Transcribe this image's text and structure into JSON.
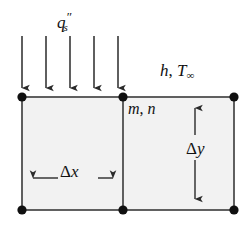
{
  "figure": {
    "name": "finite-difference-surface-node-control-volume",
    "width": 247,
    "height": 228,
    "background_color": "#ffffff",
    "line_color": "#3a3a3a",
    "node_color": "#101010",
    "cell_fill_color": "#f2f2f2"
  },
  "labels": {
    "heat_flux": {
      "base": "q",
      "subscript": "s",
      "superscript": "″",
      "full": "q″s"
    },
    "convection": {
      "h": "h",
      "comma": ",",
      "t": "T",
      "subscript": "∞",
      "full": "h, T∞"
    },
    "node_index": {
      "m": "m",
      "comma": ",",
      "n": "n",
      "full": "m, n"
    },
    "delta_x": {
      "delta": "Δ",
      "variable": "x",
      "full": "Δx"
    },
    "delta_y": {
      "delta": "Δ",
      "variable": "y",
      "full": "Δy"
    }
  },
  "geometry": {
    "grid": {
      "left_x": 22,
      "mid_x": 123,
      "right_x": 234,
      "top_y": 97,
      "bottom_y": 210
    },
    "nodes": [
      {
        "name": "node-top-left",
        "x": 22,
        "y": 97
      },
      {
        "name": "node-top-middle",
        "x": 123,
        "y": 97
      },
      {
        "name": "node-top-right",
        "x": 234,
        "y": 97
      },
      {
        "name": "node-bottom-left",
        "x": 22,
        "y": 210
      },
      {
        "name": "node-bottom-middle",
        "x": 123,
        "y": 210
      },
      {
        "name": "node-bottom-right",
        "x": 234,
        "y": 210
      }
    ],
    "flux_arrows": [
      {
        "x": 22,
        "y_start": 36,
        "y_end": 95
      },
      {
        "x": 46,
        "y_start": 36,
        "y_end": 95
      },
      {
        "x": 70,
        "y_start": 36,
        "y_end": 95
      },
      {
        "x": 94,
        "y_start": 36,
        "y_end": 95
      },
      {
        "x": 118,
        "y_start": 36,
        "y_end": 95
      }
    ],
    "dimension_delta_x": {
      "y": 178,
      "x_start": 24,
      "x_end": 121
    },
    "dimension_delta_y": {
      "x": 195,
      "y_start": 100,
      "y_end": 208
    }
  }
}
